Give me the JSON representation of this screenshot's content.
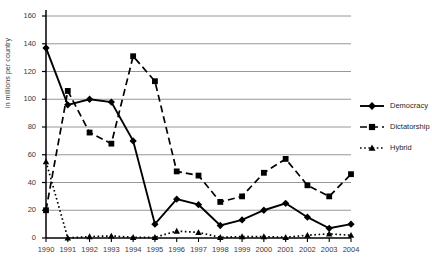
{
  "chart_data": {
    "type": "line",
    "title": "",
    "xlabel": "",
    "ylabel": "in millions per country",
    "x": [
      1990,
      1991,
      1992,
      1993,
      1994,
      1995,
      1996,
      1997,
      1998,
      1999,
      2000,
      2001,
      2002,
      2003,
      2004
    ],
    "xtick_labels": [
      "1990",
      "1991",
      "1992",
      "1993",
      "1994",
      "1995",
      "1996",
      "1997",
      "1998",
      "1999",
      "2000",
      "2001",
      "2002",
      "2003",
      "2004"
    ],
    "ylim": [
      0,
      160
    ],
    "ytick_labels": [
      "0",
      "20",
      "40",
      "60",
      "80",
      "100",
      "120",
      "140",
      "160"
    ],
    "yticks": [
      0,
      20,
      40,
      60,
      80,
      100,
      120,
      140,
      160
    ],
    "grid": true,
    "legend_position": "right",
    "series": [
      {
        "name": "Democracy",
        "marker": "diamond",
        "line_style": "solid",
        "color": "#000000",
        "values": [
          137,
          96,
          100,
          98,
          70,
          10,
          28,
          24,
          9,
          13,
          20,
          25,
          15,
          7,
          10
        ]
      },
      {
        "name": "Dictatorship",
        "marker": "square",
        "line_style": "dashed",
        "color": "#000000",
        "values": [
          20,
          106,
          76,
          68,
          131,
          113,
          48,
          45,
          26,
          30,
          47,
          57,
          38,
          30,
          46
        ]
      },
      {
        "name": "Hybrid",
        "marker": "triangle",
        "line_style": "dotted",
        "color": "#000000",
        "values": [
          55,
          0,
          1,
          1.5,
          0.5,
          0.5,
          5,
          4,
          0.5,
          1,
          1,
          0.5,
          2,
          3,
          2
        ]
      }
    ]
  },
  "legend": {
    "items": [
      {
        "label": "Democracy"
      },
      {
        "label": "Dictatorship"
      },
      {
        "label": "Hybrid"
      }
    ]
  }
}
